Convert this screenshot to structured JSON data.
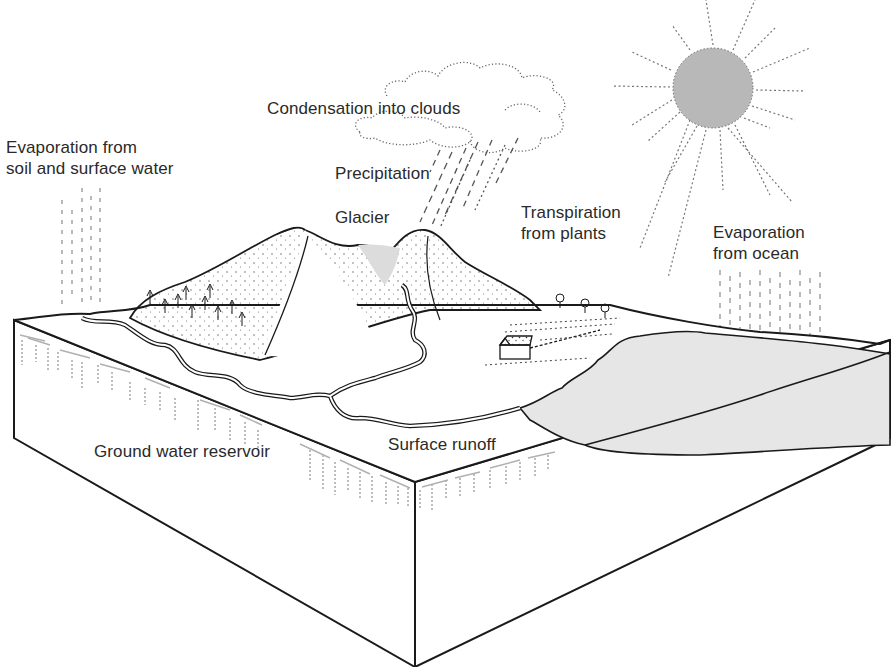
{
  "diagram": {
    "type": "water-cycle-block-diagram",
    "labels": {
      "condensation": "Condensation into clouds",
      "evaporation_soil": [
        "Evaporation from",
        "soil and surface water"
      ],
      "precipitation": "Precipitation",
      "glacier": "Glacier",
      "transpiration": [
        "Transpiration",
        "from plants"
      ],
      "evaporation_ocean": [
        "Evaporation",
        "from ocean"
      ],
      "ground_water": "Ground water reservoir",
      "surface_runoff": "Surface runoff"
    },
    "elements": [
      "sun",
      "cloud",
      "rain",
      "mountains",
      "glacier",
      "trees",
      "farmhouse",
      "river",
      "ocean",
      "land-block",
      "ground-water-marks",
      "evaporation-marks"
    ],
    "colors": {
      "line": "#1a1a1a",
      "sun_fill": "#b8b8b8",
      "ocean_fill": "#e6e6e6",
      "glacier_fill": "#dcdcdc",
      "dash": "#9a9a9a",
      "background": "#ffffff"
    }
  }
}
